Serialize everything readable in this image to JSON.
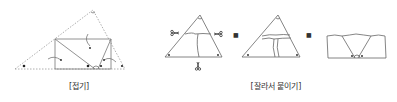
{
  "figures": [
    {
      "id": "fold",
      "caption": "[접기]",
      "description": "Triangle folded so that three vertices meet on the base"
    },
    {
      "id": "cut-paste",
      "caption": "[잘라서 붙이기]",
      "description": "Triangle cut into three angle pieces and rearranged along a line",
      "arrow_glyph": "➜"
    }
  ],
  "colors": {
    "line": "#555555",
    "dashed": "#888888",
    "dot": "#222222",
    "text": "#333333"
  }
}
